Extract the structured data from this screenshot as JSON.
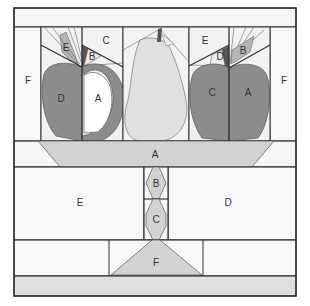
{
  "colors": {
    "background": "#f7f7f7",
    "line": "#333333",
    "light_gray": "#dcdcdc",
    "mid_gray": "#c8c8c8",
    "dark_gray": "#8a8a8a",
    "white": "#ffffff",
    "pear": "#e4e4e4"
  },
  "labels": {
    "left_f": "F",
    "apple1_e": "E",
    "apple1_c": "C",
    "apple1_b": "B",
    "apple1_d": "D",
    "apple1_a": "A",
    "apple2_e": "E",
    "apple2_d": "D",
    "apple2_b": "B",
    "apple2_c": "C",
    "apple2_a": "A",
    "right_f": "F",
    "bowl_a": "A",
    "base_e": "E",
    "base_d": "D",
    "stem_b": "B",
    "stem_c": "C",
    "foot_f": "F"
  }
}
